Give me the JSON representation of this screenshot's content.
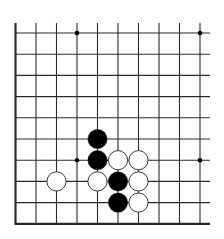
{
  "board": {
    "description": "Go board fragment (lower-left region), 10 columns x 10 rows visible",
    "colors": {
      "background": "#ffffff",
      "line": "#2a2a2a",
      "black_stone": "#000000",
      "white_stone": "#ffffff",
      "white_outline": "#222222"
    },
    "columns": 10,
    "rows": 10,
    "edges": {
      "left": true,
      "bottom": true,
      "top": false,
      "right": false
    },
    "star_points": [
      {
        "col": 3,
        "row": 0
      },
      {
        "col": 9,
        "row": 0
      },
      {
        "col": 3,
        "row": 6
      },
      {
        "col": 9,
        "row": 6
      }
    ],
    "stones": [
      {
        "color": "black",
        "col": 4,
        "row": 5
      },
      {
        "color": "black",
        "col": 4,
        "row": 6
      },
      {
        "color": "white",
        "col": 5,
        "row": 6
      },
      {
        "color": "white",
        "col": 6,
        "row": 6
      },
      {
        "color": "white",
        "col": 2,
        "row": 7
      },
      {
        "color": "white",
        "col": 4,
        "row": 7
      },
      {
        "color": "black",
        "col": 5,
        "row": 7
      },
      {
        "color": "white",
        "col": 6,
        "row": 7
      },
      {
        "color": "black",
        "col": 5,
        "row": 8
      },
      {
        "color": "white",
        "col": 6,
        "row": 8
      }
    ]
  }
}
